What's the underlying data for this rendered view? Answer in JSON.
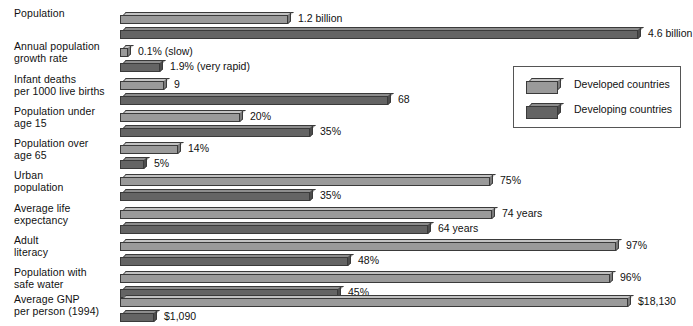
{
  "chart_data": {
    "type": "bar",
    "title": "",
    "subtitle": "",
    "orientation": "horizontal",
    "grid": false,
    "xlabel": "",
    "ylabel": "",
    "legend_position": "upper-right",
    "categories": [
      "Population",
      "Annual population growth rate",
      "Infant deaths per 1000 live births",
      "Population under age 15",
      "Population over age 65",
      "Urban population",
      "Average life expectancy",
      "Adult literacy",
      "Population with safe water",
      "Average GNP per person (1994)"
    ],
    "series": [
      {
        "name": "Developed countries",
        "color": "#9a9a9a",
        "values": [
          1.2,
          0.1,
          9,
          20,
          14,
          75,
          74,
          97,
          96,
          18130
        ],
        "labels": [
          "1.2 billion",
          "0.1% (slow)",
          "9",
          "20%",
          "14%",
          "75%",
          "74 years",
          "97%",
          "96%",
          "$18,130"
        ]
      },
      {
        "name": "Developing countries",
        "color": "#646464",
        "values": [
          4.6,
          1.9,
          68,
          35,
          5,
          35,
          64,
          48,
          45,
          1090
        ],
        "labels": [
          "4.6 billion",
          "1.9% (very rapid)",
          "68",
          "35%",
          "5%",
          "35%",
          "64 years",
          "48%",
          "45%",
          "$1,090"
        ]
      }
    ]
  },
  "rows": [
    {
      "label_line1": "Population",
      "label_line2": "",
      "top": 8,
      "bars": [
        {
          "value_label": "1.2 billion",
          "width": 168,
          "y": 4,
          "label_x": 178
        },
        {
          "value_label": "4.6 billion",
          "width": 518,
          "y": 19,
          "label_x": 528
        }
      ]
    },
    {
      "label_line1": "Annual population",
      "label_line2": "growth rate",
      "top": 41,
      "bars": [
        {
          "value_label": "0.1% (slow)",
          "width": 8,
          "y": 4,
          "label_x": 18
        },
        {
          "value_label": "1.9% (very rapid)",
          "width": 40,
          "y": 19,
          "label_x": 50
        }
      ]
    },
    {
      "label_line1": "Infant deaths",
      "label_line2": "per 1000 live births",
      "top": 74,
      "bars": [
        {
          "value_label": "9",
          "width": 44,
          "y": 4,
          "label_x": 54
        },
        {
          "value_label": "68",
          "width": 268,
          "y": 19,
          "label_x": 278
        }
      ]
    },
    {
      "label_line1": "Population under",
      "label_line2": "age 15",
      "top": 106,
      "bars": [
        {
          "value_label": "20%",
          "width": 120,
          "y": 4,
          "label_x": 130
        },
        {
          "value_label": "35%",
          "width": 190,
          "y": 19,
          "label_x": 200
        }
      ]
    },
    {
      "label_line1": "Population over",
      "label_line2": "age 65",
      "top": 138,
      "bars": [
        {
          "value_label": "14%",
          "width": 58,
          "y": 4,
          "label_x": 68
        },
        {
          "value_label": "5%",
          "width": 24,
          "y": 19,
          "label_x": 34
        }
      ]
    },
    {
      "label_line1": "Urban",
      "label_line2": "population",
      "top": 170,
      "bars": [
        {
          "value_label": "75%",
          "width": 370,
          "y": 4,
          "label_x": 380
        },
        {
          "value_label": "35%",
          "width": 190,
          "y": 19,
          "label_x": 200
        }
      ]
    },
    {
      "label_line1": "Average life",
      "label_line2": "expectancy",
      "top": 203,
      "bars": [
        {
          "value_label": "74 years",
          "width": 372,
          "y": 4,
          "label_x": 382
        },
        {
          "value_label": "64 years",
          "width": 308,
          "y": 19,
          "label_x": 318
        }
      ]
    },
    {
      "label_line1": "Adult",
      "label_line2": "literacy",
      "top": 235,
      "bars": [
        {
          "value_label": "97%",
          "width": 496,
          "y": 4,
          "label_x": 506
        },
        {
          "value_label": "48%",
          "width": 228,
          "y": 19,
          "label_x": 238
        }
      ]
    },
    {
      "label_line1": "Population with",
      "label_line2": "safe water",
      "top": 267,
      "bars": [
        {
          "value_label": "96%",
          "width": 490,
          "y": 4,
          "label_x": 500
        },
        {
          "value_label": "45%",
          "width": 218,
          "y": 19,
          "label_x": 228
        }
      ]
    },
    {
      "label_line1": "Average GNP",
      "label_line2": "per person (1994)",
      "top": 294,
      "bars": [
        {
          "value_label": "$18,130",
          "width": 508,
          "y": 1,
          "label_x": 518
        },
        {
          "value_label": "$1,090",
          "width": 34,
          "y": 16,
          "label_x": 44
        }
      ]
    }
  ],
  "legend": {
    "items": [
      {
        "label": "Developed countries",
        "series": "developed",
        "top": 11
      },
      {
        "label": "Developing countries",
        "series": "developing",
        "top": 36
      }
    ]
  }
}
